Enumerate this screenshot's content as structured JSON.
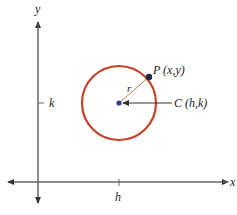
{
  "diagram": {
    "type": "circle-on-coordinate-plane",
    "axes": {
      "x_label": "x",
      "y_label": "y",
      "x_tick_label": "h",
      "y_tick_label": "k",
      "color": "#555555"
    },
    "circle": {
      "color": "#c8402a",
      "center_label": "C (h,k)",
      "radius_label": "r",
      "point_label": "P (x,y)",
      "center_color": "#2b3f8c",
      "point_color": "#1f2a44"
    }
  }
}
